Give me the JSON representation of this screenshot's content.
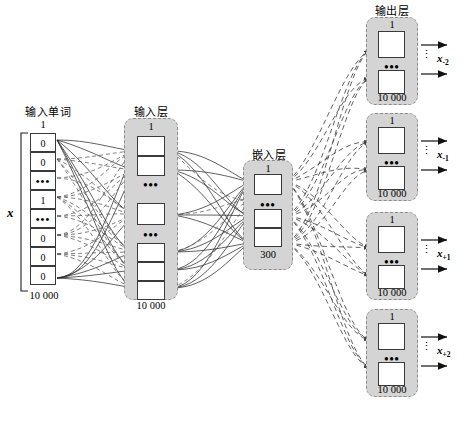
{
  "diagram": {
    "title_input_word": "输入单词",
    "title_input_layer": "输入层",
    "title_embedding_layer": "嵌入层",
    "title_output_layer": "输出层"
  },
  "input_word": {
    "x_symbol": "x",
    "top_index": "1",
    "bottom_count": "10 000",
    "cells": [
      "0",
      "0",
      "•••",
      "1",
      "•••",
      "0",
      "0",
      "0"
    ]
  },
  "input_layer": {
    "top_index": "1",
    "bottom_count": "10 000",
    "ellipsis": "•••"
  },
  "embedding_layer": {
    "top_index": "1",
    "bottom_count": "300",
    "ellipsis": "•••"
  },
  "output_layers": [
    {
      "top_index": "1",
      "bottom_count": "10 000",
      "ellipsis": "•••",
      "label": "x",
      "sub": "-2",
      "vdots": "⋮"
    },
    {
      "top_index": "1",
      "bottom_count": "10 000",
      "ellipsis": "•••",
      "label": "x",
      "sub": "-1",
      "vdots": "⋮"
    },
    {
      "top_index": "1",
      "bottom_count": "10 000",
      "ellipsis": "•••",
      "label": "x",
      "sub": "+1",
      "vdots": "⋮"
    },
    {
      "top_index": "1",
      "bottom_count": "10 000",
      "ellipsis": "•••",
      "label": "x",
      "sub": "+2",
      "vdots": "⋮"
    }
  ],
  "colors": {
    "panel_fill": "#d4d4d4",
    "panel_border": "#8c8c8c",
    "unit_border": "#3a3a3a",
    "wire": "#2b2b2b"
  }
}
